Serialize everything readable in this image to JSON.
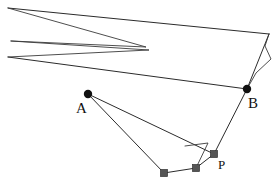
{
  "figure": {
    "name": "geometry-diagram",
    "width": 276,
    "height": 187,
    "background_color": "#ffffff",
    "stroke_color": "#2b2b2b",
    "point_color_labeled": "#111111",
    "point_color_unlabeled": "#555555"
  },
  "labels": {
    "a": "A",
    "b": "B",
    "p": "P"
  },
  "points": [
    {
      "id": "A",
      "label": "A",
      "x": 88,
      "y": 94,
      "style": "filled-black-dot",
      "radius": 4
    },
    {
      "id": "B",
      "label": "B",
      "x": 247,
      "y": 89,
      "style": "filled-black-dot",
      "radius": 4
    },
    {
      "id": "P",
      "label": "P",
      "x": 214,
      "y": 154,
      "style": "filled-gray-square",
      "radius": 3.5
    },
    {
      "id": "Q",
      "label": "",
      "x": 196,
      "y": 168,
      "style": "filled-gray-square",
      "radius": 3.5
    },
    {
      "id": "R",
      "label": "",
      "x": 164,
      "y": 173,
      "style": "filled-gray-square",
      "radius": 3.5
    }
  ],
  "vertices": {
    "top_left_apex": {
      "x": 8,
      "y": 8
    },
    "left_mid_upper": {
      "x": 11,
      "y": 41
    },
    "left_mid_lower": {
      "x": 8,
      "y": 57
    },
    "top_right": {
      "x": 269,
      "y": 34
    },
    "spike_upper": {
      "x": 266,
      "y": 46
    },
    "spike_outer": {
      "x": 270,
      "y": 59
    },
    "spike_inner": {
      "x": 257,
      "y": 73
    },
    "fan_converge": {
      "x": 146,
      "y": 47
    },
    "quad_top_left": {
      "x": 186,
      "y": 145
    },
    "quad_top_right": {
      "x": 208,
      "y": 143
    }
  },
  "polylines": [
    {
      "name": "outer-upper-edge",
      "points": "8,8 269,34"
    },
    {
      "name": "outer-lower-left-edge",
      "points": "8,57 247,89"
    },
    {
      "name": "left-zigzag-upper",
      "points": "8,8 146,47 11,41"
    },
    {
      "name": "left-zigzag-lower",
      "points": "11,41 148,49 8,57"
    },
    {
      "name": "right-spike",
      "points": "269,34 266,46 270,59 257,73 247,89"
    },
    {
      "name": "right-edge-to-B",
      "points": "269,34 247,89"
    },
    {
      "name": "lower-chain-A-R",
      "points": "88,94 164,173"
    },
    {
      "name": "lower-chain-A-P",
      "points": "88,94 214,154"
    },
    {
      "name": "bottom-chain-R-Q-P",
      "points": "164,173 196,168 214,154"
    },
    {
      "name": "quad-brace",
      "points": "186,145 208,143 196,168"
    },
    {
      "name": "B-to-P-edge",
      "points": "247,89 214,154"
    }
  ],
  "annotations": {
    "description": "Geometric reflection diagram: labeled points A, B and P with auxiliary construction lines."
  }
}
